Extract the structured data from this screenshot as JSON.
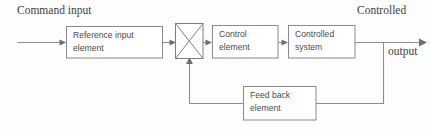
{
  "diagram": {
    "colors": {
      "background": "#fdfdfd",
      "box_border": "#8a8a8a",
      "wire": "#8d8d8d",
      "box_text": "#4a4a4a",
      "outer_text": "#3d3d3d"
    },
    "outer_labels": {
      "command_input": "Command input",
      "controlled": "Controlled",
      "output": "output"
    },
    "blocks": [
      {
        "id": "reference-input-element",
        "line1": "Reference input",
        "line2": "element"
      },
      {
        "id": "control-element",
        "line1": "Control",
        "line2": "element"
      },
      {
        "id": "controlled-system",
        "line1": "Controlled",
        "line2": "system"
      },
      {
        "id": "feedback-element",
        "line1": "Feed back",
        "line2": "element"
      }
    ],
    "summing_junction": {
      "id": "summing-junction",
      "symbol": "X"
    }
  }
}
